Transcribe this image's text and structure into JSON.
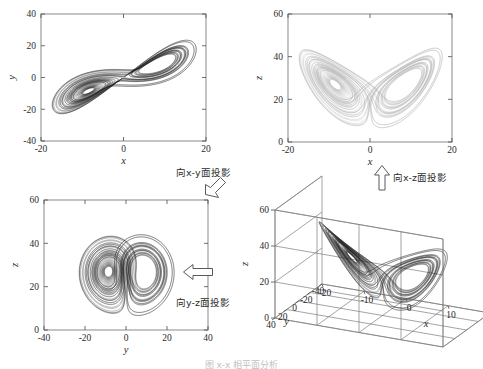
{
  "figure": {
    "caption": "图 x-x  相平面分析",
    "background": "#ffffff",
    "line_color_dark": "#1d1d1d",
    "line_color_mid": "#5e5e5e",
    "line_color_light": "#a8a8a8"
  },
  "annotations": {
    "xy": {
      "text": "向x-y面投影",
      "arrow": "arrow-down-left-icon"
    },
    "xz": {
      "text": "向x-z面投影",
      "arrow": "arrow-up-icon"
    },
    "yz": {
      "text": "向y-z面投影",
      "arrow": "arrow-left-icon"
    }
  },
  "chart_data": [
    {
      "id": "xy-projection",
      "type": "line",
      "title": "",
      "xlabel": "x",
      "ylabel": "y",
      "xlim": [
        -20,
        20
      ],
      "ylim": [
        -40,
        40
      ],
      "xticks": [
        -20,
        0,
        20
      ],
      "yticks": [
        -40,
        -20,
        0,
        20,
        40
      ],
      "xticklabels": [
        "-20",
        "0",
        "20"
      ],
      "yticklabels": [
        "-40",
        "-20",
        "0",
        "20",
        "40"
      ],
      "grid": false,
      "legend": null,
      "series": [
        {
          "name": "Lorenz attractor projected onto x-y plane",
          "color": "#1d1d1d",
          "projection": [
            "x",
            "y"
          ]
        }
      ]
    },
    {
      "id": "xz-projection",
      "type": "line",
      "title": "",
      "xlabel": "x",
      "ylabel": "z",
      "xlim": [
        -20,
        20
      ],
      "ylim": [
        0,
        60
      ],
      "xticks": [
        -20,
        0,
        20
      ],
      "yticks": [
        0,
        20,
        40,
        60
      ],
      "xticklabels": [
        "-20",
        "0",
        "20"
      ],
      "yticklabels": [
        "0",
        "20",
        "40",
        "60"
      ],
      "grid": false,
      "legend": null,
      "series": [
        {
          "name": "Lorenz attractor projected onto x-z plane",
          "color": "#a8a8a8",
          "projection": [
            "x",
            "z"
          ]
        }
      ]
    },
    {
      "id": "yz-projection",
      "type": "line",
      "title": "",
      "xlabel": "y",
      "ylabel": "z",
      "xlim": [
        -40,
        40
      ],
      "ylim": [
        0,
        60
      ],
      "xticks": [
        -40,
        -20,
        0,
        20,
        40
      ],
      "yticks": [
        0,
        20,
        40,
        60
      ],
      "xticklabels": [
        "-40",
        "-20",
        "0",
        "20",
        "40"
      ],
      "yticklabels": [
        "0",
        "20",
        "40",
        "60"
      ],
      "grid": false,
      "legend": null,
      "series": [
        {
          "name": "Lorenz attractor projected onto y-z plane",
          "color": "#1d1d1d",
          "projection": [
            "y",
            "z"
          ]
        }
      ]
    },
    {
      "id": "xyz-3d",
      "type": "line",
      "title": "",
      "xlabel": "x",
      "ylabel": "y",
      "zlabel": "z",
      "xlim": [
        -20,
        20
      ],
      "ylim": [
        -40,
        40
      ],
      "zlim": [
        0,
        60
      ],
      "xticks": [
        -20,
        -10,
        0,
        10,
        20
      ],
      "yticks": [
        -40,
        -20,
        0,
        20,
        40
      ],
      "zticks": [
        0,
        20,
        40,
        60
      ],
      "xticklabels": [
        "-20",
        "-10",
        "0",
        "10",
        "20"
      ],
      "yticklabels": [
        "-40",
        "-20",
        "0",
        "20",
        "40"
      ],
      "zticklabels": [
        "0",
        "20",
        "40",
        "60"
      ],
      "grid": true,
      "legend": null,
      "series": [
        {
          "name": "Lorenz attractor 3D trajectory",
          "color": "#1d1d1d",
          "projection": [
            "x",
            "y",
            "z"
          ]
        }
      ]
    }
  ],
  "lorenz": {
    "sigma": 10,
    "rho": 28,
    "beta": 2.6666666667,
    "x0": 1,
    "y0": 1,
    "z0": 1,
    "dt": 0.006,
    "steps": 9000
  }
}
